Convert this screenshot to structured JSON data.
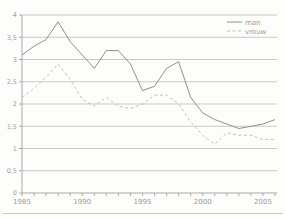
{
  "chart_data": {
    "type": "line",
    "title": "",
    "xlabel": "",
    "ylabel": "",
    "x_years": [
      1985,
      1986,
      1987,
      1988,
      1989,
      1990,
      1991,
      1992,
      1993,
      1994,
      1995,
      1996,
      1997,
      1998,
      1999,
      2000,
      2001,
      2002,
      2003,
      2004,
      2005,
      2006
    ],
    "series": [
      {
        "name": "man",
        "line_style": "solid",
        "color": "#8e918d",
        "values": [
          3.1,
          3.3,
          3.45,
          3.85,
          3.4,
          3.1,
          2.8,
          3.2,
          3.2,
          2.9,
          2.3,
          2.4,
          2.8,
          2.95,
          2.15,
          1.8,
          1.65,
          1.55,
          1.45,
          1.5,
          1.55,
          1.65
        ]
      },
      {
        "name": "vrouw",
        "line_style": "dashed",
        "color": "#bfc1bd",
        "values": [
          2.15,
          2.35,
          2.6,
          2.9,
          2.55,
          2.1,
          1.95,
          2.15,
          1.95,
          1.9,
          2.0,
          2.2,
          2.2,
          2.0,
          1.6,
          1.3,
          1.1,
          1.35,
          1.3,
          1.3,
          1.2,
          1.2
        ]
      }
    ],
    "ylim": [
      0,
      4
    ],
    "ytick_step": 0.5,
    "ytick_labels": [
      "0",
      "0,5",
      "1",
      "1,5",
      "2",
      "2,5",
      "3",
      "3,5",
      "4"
    ],
    "xtick_labeled_years": [
      1985,
      1990,
      1995,
      2000,
      2005
    ],
    "grid": "horizontal",
    "legend_position": "top-right"
  },
  "legend": {
    "items": [
      {
        "label": "man"
      },
      {
        "label": "vrouw"
      }
    ]
  },
  "colors": {
    "background": "#fdfdfb",
    "grid": "#c9c9c5",
    "axis": "#a9a9a4",
    "text": "#9b9b96",
    "divider": "#c9c9c5"
  }
}
